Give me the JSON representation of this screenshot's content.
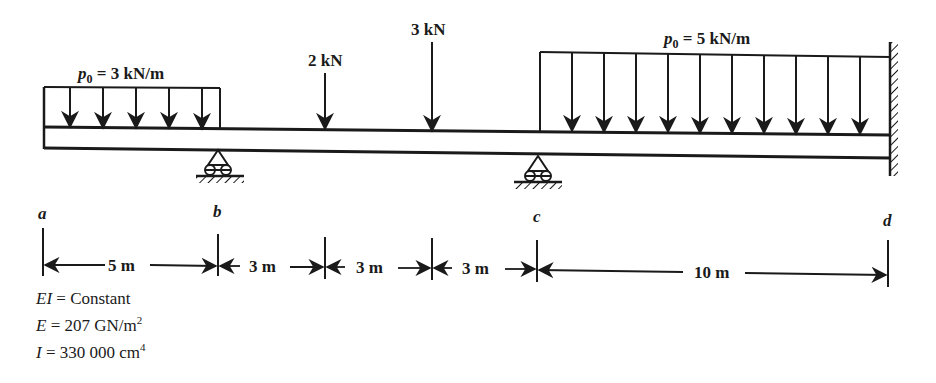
{
  "diagram": {
    "type": "beam-loading-diagram",
    "loads": {
      "udl_left": {
        "label_sym": "p",
        "label_sub": "0",
        "label_rest": " = 3 kN/m",
        "value": 3,
        "unit": "kN/m",
        "from_m": 0,
        "to_m": 5
      },
      "point_1": {
        "label": "2 kN",
        "value": 2,
        "unit": "kN",
        "at_m": 8
      },
      "point_2": {
        "label": "3 kN",
        "value": 3,
        "unit": "kN",
        "at_m": 11
      },
      "udl_right": {
        "label_sym": "p",
        "label_sub": "0",
        "label_rest": " = 5 kN/m",
        "value": 5,
        "unit": "kN/m",
        "from_m": 14,
        "to_m": 24
      }
    },
    "points": [
      {
        "name": "a",
        "label": "a",
        "support": "free end"
      },
      {
        "name": "b",
        "label": "b",
        "support": "roller"
      },
      {
        "name": "c",
        "label": "c",
        "support": "roller"
      },
      {
        "name": "d",
        "label": "d",
        "support": "fixed wall"
      }
    ],
    "dimensions": [
      {
        "label": "5 m",
        "length_m": 5
      },
      {
        "label": "3 m",
        "length_m": 3
      },
      {
        "label": "3 m",
        "length_m": 3
      },
      {
        "label": "3 m",
        "length_m": 3
      },
      {
        "label": "10 m",
        "length_m": 10
      }
    ],
    "properties": {
      "ei": {
        "sym": "EI",
        "rest": " = Constant"
      },
      "e": {
        "sym": "E",
        "rest": " = 207 GN/m",
        "sup": "2"
      },
      "i": {
        "sym": "I",
        "rest": " = 330 000 cm",
        "sup": "4"
      }
    },
    "colors": {
      "ink": "#1a1a1a",
      "background": "#ffffff"
    }
  }
}
